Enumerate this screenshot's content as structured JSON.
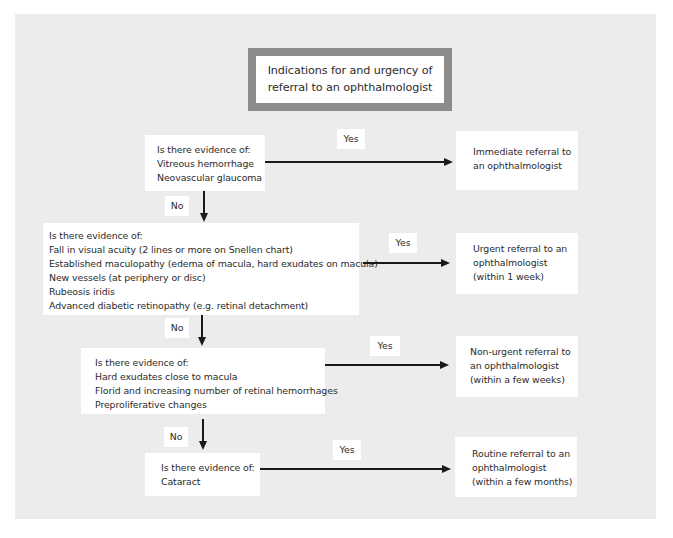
{
  "title": {
    "lines": [
      "Indications for and urgency of",
      "referral to an ophthalmologist"
    ]
  },
  "decisions": [
    {
      "lines": [
        "Is there evidence of:",
        "Vitreous hemorrhage",
        "Neovascular glaucoma"
      ]
    },
    {
      "lines": [
        "Is there evidence of:",
        "Fall in visual acuity (2 lines or more on Snellen chart)",
        "Established maculopathy (edema of macula, hard exudates on macula)",
        "New vessels (at periphery or disc)",
        "Rubeosis iridis",
        "Advanced diabetic retinopathy (e.g. retinal detachment)"
      ]
    },
    {
      "lines": [
        "Is there evidence of:",
        "Hard exudates close to macula",
        "Florid and increasing number of retinal hemorrhages",
        "Preproliferative changes"
      ]
    },
    {
      "lines": [
        "Is there evidence of:",
        "Cataract"
      ]
    }
  ],
  "outcomes": [
    {
      "lines": [
        "Immediate referral to",
        "an ophthalmologist"
      ]
    },
    {
      "lines": [
        "Urgent referral to an",
        "ophthalmologist",
        "(within 1 week)"
      ]
    },
    {
      "lines": [
        "Non-urgent referral to",
        "an ophthalmologist",
        "(within a few weeks)"
      ]
    },
    {
      "lines": [
        "Routine referral to an",
        "ophthalmologist",
        "(within a few months)"
      ]
    }
  ],
  "edge_labels": {
    "yes": "Yes",
    "no": "No"
  },
  "colors": {
    "panel": "#ececec",
    "box": "#ffffff",
    "title_border": "#8c8c8c",
    "lines": "#1a1a1a"
  }
}
